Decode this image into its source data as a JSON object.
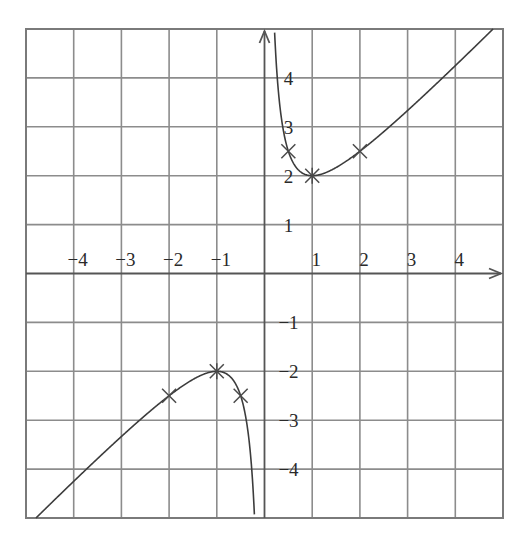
{
  "chart_data": {
    "type": "line",
    "title": "",
    "xlabel": "",
    "ylabel": "",
    "function": "y = x + 1/x",
    "xlim": [
      -5,
      5
    ],
    "ylim": [
      -5,
      5
    ],
    "grid": true,
    "x_ticks": [
      -4,
      -3,
      -2,
      -1,
      1,
      2,
      3,
      4
    ],
    "y_ticks": [
      4,
      3,
      2,
      1,
      -1,
      -2,
      -3,
      -4
    ],
    "x_tick_labels": [
      "-4",
      "-3",
      "-2",
      "-1",
      "1",
      "2",
      "3",
      "4"
    ],
    "y_tick_labels": [
      "4",
      "3",
      "2",
      "1",
      "-1",
      "-2",
      "-3",
      "-4"
    ],
    "series": [
      {
        "name": "right branch",
        "x": [
          0.2,
          0.25,
          0.5,
          1,
          2,
          3,
          4,
          4.8
        ],
        "values": [
          5.2,
          4.25,
          2.5,
          2,
          2.5,
          3.33,
          4.25,
          5.0
        ]
      },
      {
        "name": "left branch",
        "x": [
          -4.8,
          -4,
          -3,
          -2,
          -1,
          -0.5,
          -0.25,
          -0.2
        ],
        "values": [
          -5.0,
          -4.25,
          -3.33,
          -2.5,
          -2,
          -2.5,
          -4.25,
          -5.2
        ]
      }
    ],
    "marked_points": [
      {
        "x": 0.5,
        "y": 2.5
      },
      {
        "x": 1,
        "y": 2
      },
      {
        "x": 2,
        "y": 2.5
      },
      {
        "x": -0.5,
        "y": -2.5
      },
      {
        "x": -1,
        "y": -2
      },
      {
        "x": -2,
        "y": -2.5
      }
    ],
    "legend": null
  },
  "style": {
    "grid_color": "#8c8c8c",
    "curve_color": "#3c3c3c",
    "text_color": "#2a2a2a"
  }
}
